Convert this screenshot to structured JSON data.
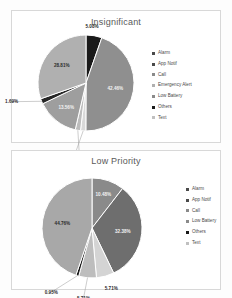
{
  "chart_data": [
    {
      "type": "pie",
      "name": "insignificant-pie",
      "title": "Insignificant",
      "categories": [
        "Alarm",
        "App Notif",
        "Call",
        "Emergency Alert",
        "Low Battery",
        "Others",
        "Text"
      ],
      "values": [
        5.08,
        42.46,
        1.69,
        1.69,
        13.56,
        1.69,
        28.81
      ],
      "labels": [
        "5.08%",
        "42.46%",
        "1.69%",
        "1.69%",
        "13.56%",
        "1.69%",
        "28.81%"
      ],
      "colors": [
        "#1a1a1a",
        "#8f8f8f",
        "#d9d9d9",
        "#bdbdbd",
        "#9e9e9e",
        "#262626",
        "#b0b0b0"
      ],
      "legend_position": "right",
      "legend": [
        "Alarm",
        "App Notif",
        "Call",
        "Emergency Alert",
        "Low Battery",
        "Others",
        "Text"
      ],
      "legend_colors": [
        "#4a4a4a",
        "#4a4a4a",
        "#8a8a8a",
        "#b0b0b0",
        "#8a8a8a",
        "#1a1a1a",
        "#c0c0c0"
      ]
    },
    {
      "type": "pie",
      "name": "low-priority-pie",
      "title": "Low Priority",
      "categories": [
        "Alarm",
        "App Notif",
        "Call",
        "Low Battery",
        "Others",
        "Text"
      ],
      "values": [
        10.48,
        32.38,
        5.71,
        5.71,
        0.95,
        44.76
      ],
      "labels": [
        "10.48%",
        "32.38%",
        "5.71%",
        "5.71%",
        "0.95%",
        "44.76%"
      ],
      "colors": [
        "#8a8a8a",
        "#6e6e6e",
        "#d4d4d4",
        "#bdbdbd",
        "#1a1a1a",
        "#a8a8a8"
      ],
      "legend_position": "right",
      "legend": [
        "Alarm",
        "App Notif",
        "Call",
        "Low Battery",
        "Others",
        "Text"
      ],
      "legend_colors": [
        "#4a4a4a",
        "#4a4a4a",
        "#8a8a8a",
        "#8a8a8a",
        "#1a1a1a",
        "#c0c0c0"
      ]
    }
  ]
}
